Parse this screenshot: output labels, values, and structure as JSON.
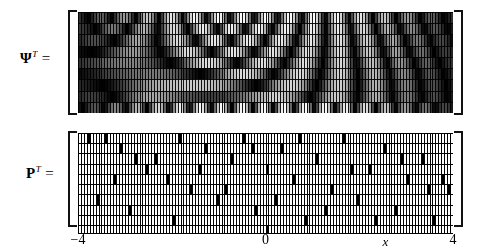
{
  "figure": {
    "title": "",
    "background_color": "#ffffff",
    "ink_color": "#111111"
  },
  "labels": {
    "psi": {
      "symbol": "Ψ",
      "superscript": "T",
      "equals": "="
    },
    "p": {
      "symbol": "P",
      "superscript": "T",
      "equals": "="
    }
  },
  "axis": {
    "name": "x",
    "min": -4,
    "max": 4,
    "ticks": [
      {
        "value": -4,
        "label": "−4",
        "pos": 0.0
      },
      {
        "value": 0,
        "label": "0",
        "pos": 0.5
      },
      {
        "value": 4,
        "label": "4",
        "pos": 1.0
      }
    ],
    "name_pos": 0.82
  },
  "chart_data": {
    "type": "heatmap",
    "title": "",
    "xlabel": "x",
    "ylabel": "",
    "xlim": [
      -4,
      4
    ],
    "grid": true,
    "legend": "none",
    "panels": [
      {
        "name": "psi-transpose",
        "label": "Ψᵀ",
        "description": "Dictionary matrix transpose: rows are oscillatory chirp-like basis functions sampled on x in [-4,4]; grayscale magnitude, black = 0, white = max.",
        "rows": 9,
        "cols": 128,
        "colormap": "grayscale",
        "value_range": [
          0,
          1
        ],
        "cell_border_color": "#000000",
        "row_params": [
          {
            "row": 0,
            "freq": 6.2,
            "chirp": 0.0,
            "phase": 0.0,
            "env": 1.0
          },
          {
            "row": 1,
            "freq": 5.4,
            "chirp": 0.55,
            "phase": 0.8,
            "env": 0.95
          },
          {
            "row": 2,
            "freq": 4.6,
            "chirp": 0.95,
            "phase": 1.7,
            "env": 0.92
          },
          {
            "row": 3,
            "freq": 3.9,
            "chirp": 1.35,
            "phase": 2.55,
            "env": 0.9
          },
          {
            "row": 4,
            "freq": 3.2,
            "chirp": 1.7,
            "phase": 3.4,
            "env": 0.88
          },
          {
            "row": 5,
            "freq": 2.55,
            "chirp": 2.05,
            "phase": 4.25,
            "env": 0.86
          },
          {
            "row": 6,
            "freq": 1.95,
            "chirp": 2.4,
            "phase": 5.1,
            "env": 0.84
          },
          {
            "row": 7,
            "freq": 1.4,
            "chirp": 2.75,
            "phase": 5.95,
            "env": 0.82
          },
          {
            "row": 8,
            "freq": 7.1,
            "chirp": 0.2,
            "phase": 0.4,
            "env": 1.0
          }
        ]
      },
      {
        "name": "p-transpose",
        "label": "Pᵀ",
        "description": "Sampling / measurement matrix transpose: mostly white cells with one black cell per column-group marking a randomly selected sample location.",
        "rows": 9,
        "cols": 128,
        "colormap": "binary",
        "fill_color": "#ffffff",
        "mark_color": "#000000",
        "cell_border_color": "#000000",
        "marks": [
          [
            0,
            9
          ],
          [
            1,
            14
          ],
          [
            2,
            19
          ],
          [
            3,
            23
          ],
          [
            4,
            30
          ],
          [
            0,
            34
          ],
          [
            5,
            38
          ],
          [
            1,
            43
          ],
          [
            6,
            47
          ],
          [
            2,
            52
          ],
          [
            0,
            56
          ],
          [
            7,
            60
          ],
          [
            3,
            64
          ],
          [
            1,
            69
          ],
          [
            4,
            73
          ],
          [
            8,
            77
          ],
          [
            2,
            81
          ],
          [
            5,
            86
          ],
          [
            0,
            90
          ],
          [
            6,
            95
          ],
          [
            3,
            99
          ],
          [
            1,
            104
          ],
          [
            7,
            108
          ],
          [
            4,
            112
          ],
          [
            2,
            117
          ],
          [
            8,
            121
          ],
          [
            5,
            126
          ],
          [
            0,
            3
          ],
          [
            6,
            6
          ],
          [
            4,
            12
          ],
          [
            7,
            17
          ],
          [
            2,
            26
          ],
          [
            8,
            32
          ],
          [
            3,
            41
          ],
          [
            5,
            50
          ],
          [
            1,
            59
          ],
          [
            6,
            67
          ],
          [
            0,
            75
          ],
          [
            7,
            84
          ],
          [
            3,
            93
          ],
          [
            8,
            101
          ],
          [
            2,
            110
          ],
          [
            5,
            119
          ],
          [
            4,
            124
          ]
        ]
      },
      {
        "name": "axis-row",
        "description": "Single row of cells along the x-axis; one black cell marks the sample at x = 0.",
        "rows": 1,
        "cols": 128,
        "colormap": "binary",
        "fill_color": "#ffffff",
        "mark_color": "#000000",
        "marks": [
          [
            0,
            64
          ]
        ]
      }
    ]
  }
}
